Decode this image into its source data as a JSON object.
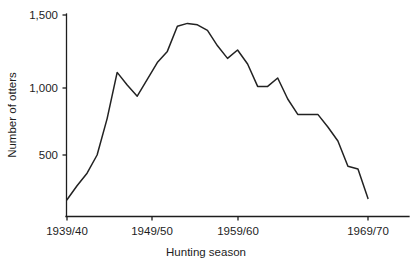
{
  "chart_data": {
    "type": "line",
    "title": "",
    "xlabel": "Hunting season",
    "ylabel": "Number of otters",
    "xtick_labels": [
      "1939/40",
      "1949/50",
      "1959/60",
      "1969/70"
    ],
    "xtick_values": [
      1939,
      1949,
      1959,
      1969
    ],
    "ytick_labels": [
      "500",
      "1,000",
      "1,500"
    ],
    "ytick_values": [
      500,
      1000,
      1500
    ],
    "ylim": [
      0,
      1500
    ],
    "xlim": [
      1939,
      1971
    ],
    "grid": false,
    "legend": null,
    "series": [
      {
        "name": "Number of otters",
        "x": [
          1939,
          1940,
          1941,
          1942,
          1943,
          1944,
          1945,
          1946,
          1947,
          1948,
          1949,
          1950,
          1951,
          1952,
          1953,
          1954,
          1955,
          1956,
          1957,
          1958,
          1959,
          1960,
          1961,
          1962,
          1963,
          1964,
          1965,
          1966,
          1967,
          1968,
          1969
        ],
        "values": [
          180,
          280,
          370,
          500,
          760,
          1090,
          1000,
          920,
          1040,
          1160,
          1240,
          1420,
          1440,
          1430,
          1390,
          1280,
          1190,
          1250,
          1150,
          990,
          990,
          1050,
          900,
          790,
          790,
          790,
          700,
          600,
          420,
          400,
          190
        ]
      }
    ]
  },
  "axes": {
    "y_label": "Number of otters",
    "x_label": "Hunting season"
  }
}
